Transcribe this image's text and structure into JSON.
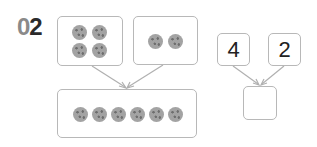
{
  "problem_number": {
    "digit0": "0",
    "digit1": "2"
  },
  "left_diagram": {
    "group_a": {
      "cookie_count": 4,
      "icon": "cookie-icon"
    },
    "group_b": {
      "cookie_count": 2,
      "icon": "cookie-icon"
    },
    "total": {
      "cookie_count": 6,
      "icon": "cookie-icon"
    }
  },
  "right_diagram": {
    "addend_1": "4",
    "addend_2": "2",
    "answer": ""
  },
  "colors": {
    "border": "#b8b8b8",
    "cookie": "#a3a3a3",
    "number_dark": "#2b2b2b",
    "number_light": "#8a8a8a"
  }
}
